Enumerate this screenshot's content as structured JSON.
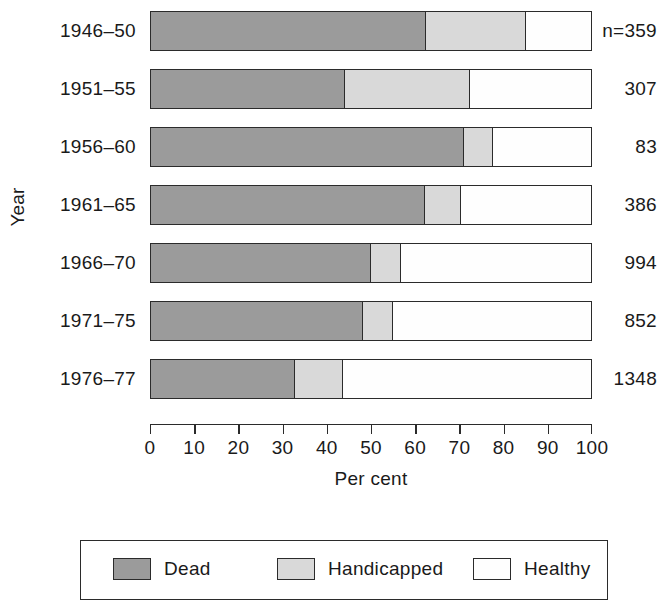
{
  "chart_data": {
    "type": "bar",
    "orientation": "horizontal",
    "stacked": true,
    "stack_total": 100,
    "title": "",
    "xlabel": "Per cent",
    "ylabel": "Year",
    "xlim": [
      0,
      100
    ],
    "grid": false,
    "legend_position": "bottom",
    "categories": [
      "1946–50",
      "1951–55",
      "1956–60",
      "1961–65",
      "1966–70",
      "1971–75",
      "1976–77"
    ],
    "xtick_labels": [
      "0",
      "10",
      "20",
      "30",
      "40",
      "50",
      "60",
      "70",
      "80",
      "90",
      "100"
    ],
    "xtick_values": [
      0,
      10,
      20,
      30,
      40,
      50,
      60,
      70,
      80,
      90,
      100
    ],
    "series": [
      {
        "name": "Dead",
        "color": "#9b9b9b",
        "values": [
          62.2,
          43.9,
          70.8,
          62.0,
          49.8,
          47.9,
          32.6
        ]
      },
      {
        "name": "Handicapped",
        "color": "#d9d9d9",
        "values": [
          22.6,
          28.3,
          6.6,
          8.1,
          6.8,
          6.9,
          10.8
        ]
      },
      {
        "name": "Healthy",
        "color": "#fefefe",
        "values": [
          15.2,
          27.8,
          22.6,
          29.9,
          43.4,
          45.2,
          56.6
        ]
      }
    ],
    "annotations": [
      {
        "label": "n=359",
        "category": "1946–50"
      },
      {
        "label": "307",
        "category": "1951–55"
      },
      {
        "label": "83",
        "category": "1956–60"
      },
      {
        "label": "386",
        "category": "1961–65"
      },
      {
        "label": "994",
        "category": "1966–70"
      },
      {
        "label": "852",
        "category": "1971–75"
      },
      {
        "label": "1348",
        "category": "1976–77"
      }
    ]
  },
  "rows": [
    {
      "year": "1946–50",
      "n": "n=359",
      "dead": 62.2,
      "handicapped": 22.6,
      "healthy": 15.2
    },
    {
      "year": "1951–55",
      "n": "307",
      "dead": 43.9,
      "handicapped": 28.3,
      "healthy": 27.8
    },
    {
      "year": "1956–60",
      "n": "83",
      "dead": 70.8,
      "handicapped": 6.6,
      "healthy": 22.6
    },
    {
      "year": "1961–65",
      "n": "386",
      "dead": 62.0,
      "handicapped": 8.1,
      "healthy": 29.9
    },
    {
      "year": "1966–70",
      "n": "994",
      "dead": 49.8,
      "handicapped": 6.8,
      "healthy": 43.4
    },
    {
      "year": "1971–75",
      "n": "852",
      "dead": 47.9,
      "handicapped": 6.9,
      "healthy": 45.2
    },
    {
      "year": "1976–77",
      "n": "1348",
      "dead": 32.6,
      "handicapped": 10.8,
      "healthy": 56.6
    }
  ],
  "axes": {
    "y_title": "Year",
    "x_title": "Per cent",
    "x_ticks": [
      "0",
      "10",
      "20",
      "30",
      "40",
      "50",
      "60",
      "70",
      "80",
      "90",
      "100"
    ]
  },
  "legend": {
    "items": [
      {
        "label": "Dead",
        "color": "#9b9b9b"
      },
      {
        "label": "Handicapped",
        "color": "#d9d9d9"
      },
      {
        "label": "Healthy",
        "color": "#fefefe"
      }
    ]
  }
}
